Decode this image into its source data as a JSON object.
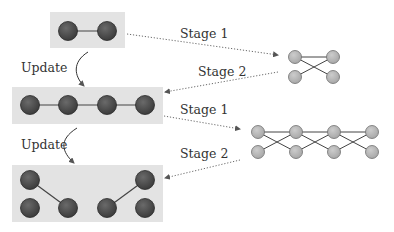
{
  "colors": {
    "box_fill": "#e3e3e3",
    "dark_node": "#505050",
    "dark_node_stroke": "#2a2a2a",
    "light_node": "#b4b4b4",
    "light_node_stroke": "#6e6e6e",
    "edge": "#444444",
    "arrow": "#6a6a6a"
  },
  "labels": {
    "update_1": "Update",
    "update_2": "Update",
    "stage1_top": "Stage 1",
    "stage2_top": "Stage 2",
    "stage1_mid": "Stage 1",
    "stage2_mid": "Stage 2"
  },
  "left_graphs": [
    {
      "name": "graph-level-1",
      "box": {
        "x": 50,
        "y": 12,
        "w": 75,
        "h": 36
      },
      "nodes": [
        [
          68,
          31
        ],
        [
          107,
          31
        ]
      ],
      "edges": [
        [
          0,
          1
        ]
      ]
    },
    {
      "name": "graph-level-2",
      "box": {
        "x": 12,
        "y": 87,
        "w": 151,
        "h": 37
      },
      "nodes": [
        [
          30,
          105
        ],
        [
          68,
          105
        ],
        [
          107,
          105
        ],
        [
          145,
          105
        ]
      ],
      "edges": [
        [
          0,
          1
        ],
        [
          1,
          2
        ],
        [
          2,
          3
        ]
      ]
    },
    {
      "name": "graph-level-3",
      "box": {
        "x": 12,
        "y": 165,
        "w": 151,
        "h": 57
      },
      "nodes": [
        [
          30,
          180
        ],
        [
          30,
          208
        ],
        [
          68,
          208
        ],
        [
          107,
          208
        ],
        [
          145,
          180
        ],
        [
          145,
          208
        ]
      ],
      "edges": [
        [
          0,
          2
        ],
        [
          3,
          4
        ]
      ]
    }
  ],
  "right_graphs": [
    {
      "name": "lifted-graph-1",
      "nodes": [
        [
          295,
          57
        ],
        [
          333,
          57
        ],
        [
          295,
          77
        ],
        [
          333,
          77
        ]
      ],
      "edges": [
        [
          0,
          1
        ],
        [
          0,
          3
        ],
        [
          2,
          1
        ]
      ]
    },
    {
      "name": "lifted-graph-2",
      "nodes": [
        [
          258,
          132
        ],
        [
          296,
          132
        ],
        [
          334,
          132
        ],
        [
          372,
          132
        ],
        [
          258,
          152
        ],
        [
          296,
          152
        ],
        [
          334,
          152
        ],
        [
          372,
          152
        ]
      ],
      "edges": [
        [
          0,
          1
        ],
        [
          1,
          2
        ],
        [
          2,
          3
        ],
        [
          0,
          5
        ],
        [
          4,
          1
        ],
        [
          1,
          6
        ],
        [
          5,
          2
        ],
        [
          2,
          7
        ],
        [
          6,
          3
        ]
      ]
    }
  ]
}
